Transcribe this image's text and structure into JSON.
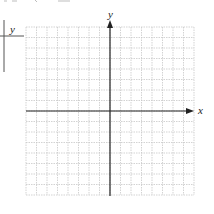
{
  "top_fragment": {
    "note": "Clipped text at the top edge is illegible and intentionally omitted"
  },
  "side_table": {
    "header_label": "y"
  },
  "graph": {
    "x_label": "x",
    "y_label": "y",
    "grid_cells": 16,
    "colors": {
      "grid": "#c8c8c8",
      "axis": "#222222",
      "label": "#222222"
    }
  }
}
